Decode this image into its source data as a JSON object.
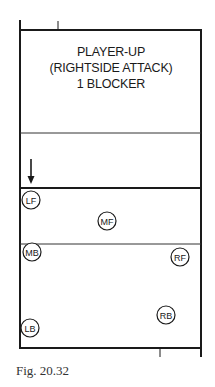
{
  "diagram": {
    "title_lines": [
      "PLAYER-UP",
      "(RIGHTSIDE ATTACK)",
      "1 BLOCKER"
    ],
    "caption": "Fig. 20.32",
    "colors": {
      "line": "#1a1a1a",
      "background": "#ffffff"
    },
    "court": {
      "left": 20,
      "right": 201,
      "top": 30,
      "bottom": 348,
      "opponent_attack_line_y": 133,
      "net_y": 188,
      "attack_line_y": 244
    },
    "arrow": {
      "label": "attack-direction",
      "x": 31,
      "y_start": 159,
      "y_end": 184
    },
    "players": [
      {
        "label": "LF",
        "x": 31,
        "y": 200
      },
      {
        "label": "MF",
        "x": 107,
        "y": 221
      },
      {
        "label": "MB",
        "x": 32,
        "y": 252
      },
      {
        "label": "RF",
        "x": 180,
        "y": 257
      },
      {
        "label": "RB",
        "x": 166,
        "y": 315
      },
      {
        "label": "LB",
        "x": 30,
        "y": 328
      }
    ]
  }
}
